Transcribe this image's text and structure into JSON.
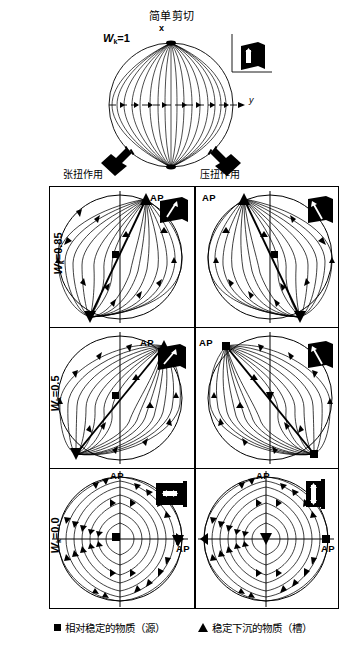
{
  "figure": {
    "top": {
      "title": "简单剪切",
      "wk_label": "W",
      "wk_sub": "k",
      "wk_value": "=1",
      "axis_x": "x",
      "axis_y": "y",
      "icon_axis_x": "x",
      "icon_axis_y": "y",
      "icon_name": "simple-shear-strain-block"
    },
    "columns": [
      {
        "label": "张扭作用",
        "key": "transtension"
      },
      {
        "label": "压扭作用",
        "key": "transpression"
      }
    ],
    "rows": [
      {
        "label_prefix": "W",
        "label_sub": "k",
        "label_value": "=0.85"
      },
      {
        "label_prefix": "W",
        "label_sub": "k",
        "label_value": "=0.5"
      },
      {
        "label_prefix": "W",
        "label_sub": "k",
        "label_value": "=0.0"
      }
    ],
    "cells": [
      {
        "row": 0,
        "col": 0,
        "ap_labels": [
          "AP"
        ],
        "marker_top": "triangle",
        "marker_center": "square",
        "marker_bottom": "triangle",
        "icon": "strain-block-dextral-steep"
      },
      {
        "row": 0,
        "col": 1,
        "ap_labels": [
          "AP"
        ],
        "marker_top": "triangle",
        "marker_center": "square",
        "marker_bottom": "triangle",
        "icon": "strain-block-sinistral-steep"
      },
      {
        "row": 1,
        "col": 0,
        "ap_labels": [
          "AP"
        ],
        "marker_top": "triangle",
        "marker_center": "square",
        "marker_bottom": "triangle",
        "icon": "strain-block-dextral-45"
      },
      {
        "row": 1,
        "col": 1,
        "ap_labels": [
          "AP"
        ],
        "marker_top": "square",
        "marker_center": "triangle",
        "marker_bottom": "square",
        "icon": "strain-block-sinistral-45"
      },
      {
        "row": 2,
        "col": 0,
        "ap_labels": [
          "AP",
          "AP"
        ],
        "marker_top": "none",
        "marker_center": "square",
        "marker_right": "triangle",
        "icon": "strain-block-flattening"
      },
      {
        "row": 2,
        "col": 1,
        "ap_labels": [
          "AP",
          "AP"
        ],
        "marker_top": "none",
        "marker_center": "triangle",
        "marker_right": "square",
        "icon": "strain-block-constriction"
      }
    ],
    "arrows": [
      {
        "name": "transtension-arrow",
        "direction": "down-left"
      },
      {
        "name": "transpression-arrow",
        "direction": "down-right"
      }
    ],
    "legend": [
      {
        "symbol": "square",
        "text": "相对稳定的物质（源）"
      },
      {
        "symbol": "triangle",
        "text": "稳定下沉的物质（槽）"
      }
    ],
    "colors": {
      "stroke": "#000000",
      "background": "#ffffff"
    }
  }
}
